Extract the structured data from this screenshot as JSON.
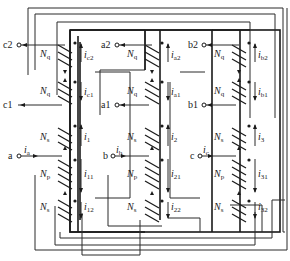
{
  "figure": {
    "type": "three-phase transformer winding diagram",
    "limbs": [
      {
        "phase": "a",
        "input_terminal": "a",
        "input_current": {
          "main": "i",
          "sub": "a"
        },
        "windings": [
          {
            "turns": {
              "main": "N",
              "sub": "q"
            },
            "terminal": "c2",
            "current": {
              "main": "i",
              "sub": "c2"
            }
          },
          {
            "turns": {
              "main": "N",
              "sub": "q"
            },
            "terminal": "c1",
            "current": {
              "main": "i",
              "sub": "c1"
            }
          },
          {
            "turns": {
              "main": "N",
              "sub": "s"
            },
            "current": {
              "main": "i",
              "sub": "1"
            }
          },
          {
            "turns": {
              "main": "N",
              "sub": "p"
            },
            "current": {
              "main": "i",
              "sub": "11"
            }
          },
          {
            "turns": {
              "main": "N",
              "sub": "s"
            },
            "current": {
              "main": "i",
              "sub": "12"
            }
          }
        ]
      },
      {
        "phase": "b",
        "input_terminal": "b",
        "input_current": {
          "main": "i",
          "sub": "b"
        },
        "windings": [
          {
            "turns": {
              "main": "N",
              "sub": "q"
            },
            "terminal": "a2",
            "current": {
              "main": "i",
              "sub": "a2"
            }
          },
          {
            "turns": {
              "main": "N",
              "sub": "q"
            },
            "terminal": "a1",
            "current": {
              "main": "i",
              "sub": "a1"
            }
          },
          {
            "turns": {
              "main": "N",
              "sub": "s"
            },
            "current": {
              "main": "i",
              "sub": "2"
            }
          },
          {
            "turns": {
              "main": "N",
              "sub": "p"
            },
            "current": {
              "main": "i",
              "sub": "21"
            }
          },
          {
            "turns": {
              "main": "N",
              "sub": "s"
            },
            "current": {
              "main": "i",
              "sub": "22"
            }
          }
        ]
      },
      {
        "phase": "c",
        "input_terminal": "c",
        "input_current": {
          "main": "i",
          "sub": "c"
        },
        "windings": [
          {
            "turns": {
              "main": "N",
              "sub": "q"
            },
            "terminal": "b2",
            "current": {
              "main": "i",
              "sub": "b2"
            }
          },
          {
            "turns": {
              "main": "N",
              "sub": "q"
            },
            "terminal": "b1",
            "current": {
              "main": "i",
              "sub": "b1"
            }
          },
          {
            "turns": {
              "main": "N",
              "sub": "s"
            },
            "current": {
              "main": "i",
              "sub": "3"
            }
          },
          {
            "turns": {
              "main": "N",
              "sub": "p"
            },
            "current": {
              "main": "i",
              "sub": "31"
            }
          },
          {
            "turns": {
              "main": "N",
              "sub": "s"
            },
            "current": {
              "main": "i",
              "sub": "32"
            }
          }
        ]
      }
    ]
  },
  "labels": {
    "c2": "c2",
    "c1": "c1",
    "a2": "a2",
    "a1": "a1",
    "b2": "b2",
    "b1": "b1",
    "a": "a",
    "b": "b",
    "c": "c",
    "N": "N",
    "i": "i",
    "q": "q",
    "s": "s",
    "p": "p",
    "sub_a": "a",
    "sub_b": "b",
    "sub_c": "c",
    "sub_c2": "c2",
    "sub_c1": "c1",
    "sub_a2": "a2",
    "sub_a1": "a1",
    "sub_b2": "b2",
    "sub_b1": "b1",
    "sub_1": "1",
    "sub_11": "11",
    "sub_12": "12",
    "sub_2": "2",
    "sub_21": "21",
    "sub_22": "22",
    "sub_3": "3",
    "sub_31": "31",
    "sub_32": "32"
  },
  "colors": {
    "ink": "#1a1a1a",
    "background": "#ffffff"
  }
}
